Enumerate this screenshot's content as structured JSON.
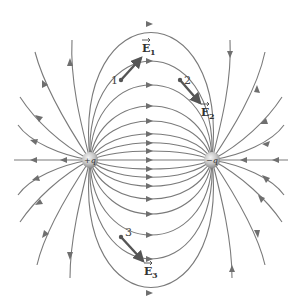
{
  "diagram": {
    "charges": [
      {
        "id": "positive",
        "label": "+q",
        "x": 90,
        "y": 160
      },
      {
        "id": "negative",
        "label": "−q",
        "x": 212,
        "y": 160
      }
    ],
    "points": [
      {
        "id": "1",
        "label": "1",
        "x": 121,
        "y": 80
      },
      {
        "id": "2",
        "label": "2",
        "x": 180,
        "y": 80
      },
      {
        "id": "3",
        "label": "3",
        "x": 121,
        "y": 237
      }
    ],
    "field_vectors": [
      {
        "id": "E1",
        "symbol": "E",
        "subscript": "1",
        "at_point": "1"
      },
      {
        "id": "E2",
        "symbol": "E",
        "subscript": "2",
        "at_point": "2"
      },
      {
        "id": "E3",
        "symbol": "E",
        "subscript": "3",
        "at_point": "3"
      }
    ],
    "colors": {
      "field_line": "#7a7a7a",
      "vector": "#555555",
      "charge": "#bdbdbd"
    }
  }
}
